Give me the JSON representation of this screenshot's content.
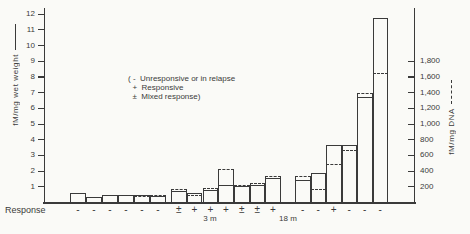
{
  "ink_color": "#3a3a3a",
  "paper_color": "#fafaf7",
  "chart_data": {
    "type": "bar",
    "title": "",
    "left_axis": {
      "label": "fM/mg wet weight",
      "line_style": "solid",
      "ylim": [
        0,
        12.4
      ],
      "ticks": [
        {
          "v": 1,
          "label": "1"
        },
        {
          "v": 2,
          "label": "2"
        },
        {
          "v": 3,
          "label": "3"
        },
        {
          "v": 4,
          "label": "4"
        },
        {
          "v": 5,
          "label": "5"
        },
        {
          "v": 6,
          "label": "6"
        },
        {
          "v": 7,
          "label": "7"
        },
        {
          "v": 8,
          "label": "8"
        },
        {
          "v": 9,
          "label": "9"
        },
        {
          "v": 10,
          "label": "10"
        },
        {
          "v": 11,
          "label": "11"
        },
        {
          "v": 12,
          "label": "12"
        }
      ]
    },
    "right_axis": {
      "label": "fM/mg DNA",
      "line_style": "dashed",
      "ylim": [
        0,
        2480
      ],
      "units_per_left_unit": 200,
      "ticks": [
        {
          "v": 200,
          "label": "200"
        },
        {
          "v": 400,
          "label": "400"
        },
        {
          "v": 600,
          "label": "600"
        },
        {
          "v": 800,
          "label": "800"
        },
        {
          "v": 1000,
          "label": "1,000"
        },
        {
          "v": 1200,
          "label": "1,200"
        },
        {
          "v": 1400,
          "label": "1,400"
        },
        {
          "v": 1600,
          "label": "1,600"
        },
        {
          "v": 1800,
          "label": "1,800"
        }
      ]
    },
    "legend": {
      "lines": [
        "( -  Unresponsive or in relapse",
        "  +  Responsive",
        "  ±  Mixed response)"
      ]
    },
    "response_label": "Response",
    "group_labels": [
      {
        "text": "3 m",
        "center_x": 210
      },
      {
        "text": "18 m",
        "center_x": 288
      }
    ],
    "bars": [
      {
        "x": 70,
        "w": 16,
        "wet": 0.55,
        "dna": 115,
        "response": "-"
      },
      {
        "x": 86,
        "w": 16,
        "wet": 0.35,
        "dna": 68,
        "response": "-"
      },
      {
        "x": 102,
        "w": 16,
        "wet": 0.42,
        "dna": 92,
        "response": "-"
      },
      {
        "x": 118,
        "w": 16,
        "wet": 0.46,
        "dna": 88,
        "response": "-"
      },
      {
        "x": 134,
        "w": 16,
        "wet": 0.44,
        "dna": 80,
        "response": "-"
      },
      {
        "x": 150,
        "w": 16,
        "wet": 0.4,
        "dna": 84,
        "response": "-"
      },
      {
        "x": 171,
        "w": 15.7,
        "wet": 0.7,
        "dna": 168,
        "response": "±"
      },
      {
        "x": 186.5,
        "w": 15.7,
        "wet": 0.55,
        "dna": 95,
        "response": "+"
      },
      {
        "x": 202.5,
        "w": 15.7,
        "wet": 0.75,
        "dna": 175,
        "response": "+"
      },
      {
        "x": 218,
        "w": 15.7,
        "wet": 1.1,
        "dna": 420,
        "response": "+"
      },
      {
        "x": 234,
        "w": 15.7,
        "wet": 1.05,
        "dna": 222,
        "response": "±"
      },
      {
        "x": 249.5,
        "w": 15.7,
        "wet": 1.1,
        "dna": 240,
        "response": "±"
      },
      {
        "x": 265,
        "w": 15.7,
        "wet": 1.5,
        "dna": 330,
        "response": "+"
      },
      {
        "x": 295,
        "w": 15.5,
        "wet": 1.4,
        "dna": 335,
        "response": "-"
      },
      {
        "x": 310.5,
        "w": 15.5,
        "wet": 1.85,
        "dna": 165,
        "response": "-"
      },
      {
        "x": 326,
        "w": 15.5,
        "wet": 3.6,
        "dna": 485,
        "response": "+"
      },
      {
        "x": 341.5,
        "w": 15.5,
        "wet": 3.6,
        "dna": 660,
        "response": "-"
      },
      {
        "x": 357,
        "w": 15.5,
        "wet": 6.7,
        "dna": 1390,
        "response": "-"
      },
      {
        "x": 372.5,
        "w": 15.5,
        "wet": 11.7,
        "dna": 1640,
        "response": "-"
      }
    ],
    "layout": {
      "left_x": 44,
      "right_x": 414,
      "base_y": 202,
      "top_y": 8,
      "px_per_left_unit": 15.7,
      "grid": false,
      "legend_position": "upper-center"
    }
  }
}
